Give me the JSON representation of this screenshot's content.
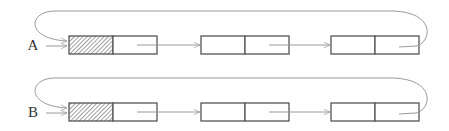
{
  "diagram": {
    "type": "circular-linked-list",
    "colors": {
      "box_stroke": "#555555",
      "arrow": "#9a9a9a",
      "hatch": "#777777",
      "label": "#333333"
    },
    "lists": [
      {
        "label": "A",
        "nodes": [
          {
            "id": "A1",
            "head": true
          },
          {
            "id": "A2",
            "head": false
          },
          {
            "id": "A3",
            "head": false
          }
        ],
        "last_node_links_back_to_head": true
      },
      {
        "label": "B",
        "nodes": [
          {
            "id": "B1",
            "head": true
          },
          {
            "id": "B2",
            "head": false
          },
          {
            "id": "B3",
            "head": false
          }
        ],
        "last_node_links_back_to_head": true
      }
    ]
  }
}
